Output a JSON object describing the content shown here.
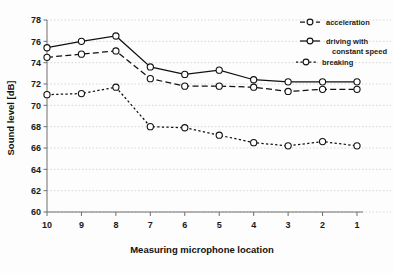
{
  "chart_data": {
    "type": "line",
    "title": "",
    "subtitle": "",
    "xlabel": "Measuring microphone location",
    "ylabel": "Sound level [dB]",
    "categories": [
      "10",
      "9",
      "8",
      "7",
      "6",
      "5",
      "4",
      "3",
      "2",
      "1"
    ],
    "x": [
      10,
      9,
      8,
      7,
      6,
      5,
      4,
      3,
      2,
      1
    ],
    "ylim": [
      60,
      78
    ],
    "yticks": [
      60,
      62,
      64,
      66,
      68,
      70,
      72,
      74,
      76,
      78
    ],
    "ytick_labels": [
      "60",
      "62",
      "64",
      "66",
      "68",
      "70",
      "72",
      "74",
      "76",
      "78"
    ],
    "xtick_labels": [
      "10",
      "9",
      "8",
      "7",
      "6",
      "5",
      "4",
      "3",
      "2",
      "1"
    ],
    "grid": "horizontal-dotted",
    "legend_position": "top-right-outside",
    "series": [
      {
        "name": "acceleration",
        "style": "dashed",
        "marker": "open-circle",
        "values": [
          74.5,
          74.8,
          75.1,
          72.5,
          71.8,
          71.8,
          71.7,
          71.3,
          71.5,
          71.5
        ]
      },
      {
        "name": "driving with constant speed",
        "style": "solid",
        "marker": "open-circle",
        "values": [
          75.4,
          76.0,
          76.5,
          73.6,
          72.9,
          73.3,
          72.4,
          72.2,
          72.2,
          72.2
        ]
      },
      {
        "name": "breaking",
        "style": "dotted",
        "marker": "open-circle",
        "values": [
          71.0,
          71.1,
          71.7,
          68.0,
          67.9,
          67.2,
          66.5,
          66.2,
          66.6,
          66.2
        ]
      }
    ],
    "colors": {
      "series": "#111111",
      "grid": "#c9c9c9",
      "axis": "#6f6f6f",
      "background": "#fdfdfd"
    }
  },
  "legend": {
    "items": [
      {
        "label": "acceleration"
      },
      {
        "label": "driving with"
      },
      {
        "label": "constant speed"
      },
      {
        "label": "breaking"
      }
    ]
  }
}
